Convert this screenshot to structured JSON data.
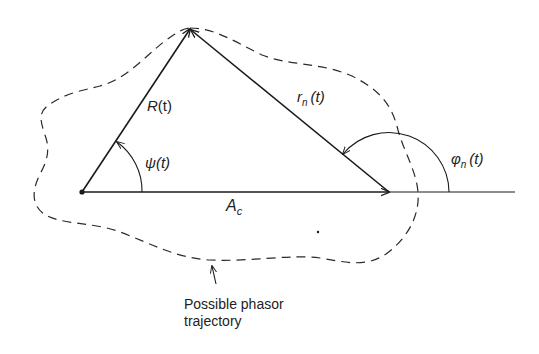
{
  "figure": {
    "type": "phasor-diagram",
    "colors": {
      "stroke": "#1a1a1a",
      "background": "#ffffff"
    },
    "vectors": {
      "resultant": {
        "label": "R(t)",
        "label_main": "R",
        "label_arg": "(t)"
      },
      "noise": {
        "label": "r_n(t)",
        "label_main": "r",
        "label_sub": "n",
        "label_arg": "(t)"
      },
      "carrier": {
        "label": "A_c",
        "label_main": "A",
        "label_sub": "c"
      }
    },
    "angles": {
      "psi": {
        "label": "ψ(t)",
        "label_main": "ψ",
        "label_arg": "(t)"
      },
      "phi": {
        "label": "φ_n(t)",
        "label_main": "φ",
        "label_sub": "n",
        "label_arg": "(t)"
      }
    },
    "trajectory": {
      "annotation_line1": "Possible phasor",
      "annotation_line2": "trajectory"
    }
  }
}
